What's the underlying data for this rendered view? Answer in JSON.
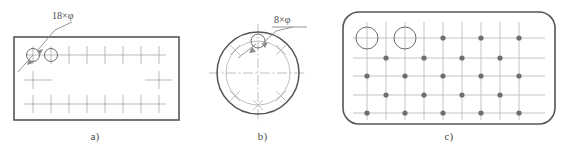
{
  "figure": {
    "background_color": "#ffffff",
    "line_color": "#6b6b6b",
    "outline_color": "#555555",
    "construction_color": "#b0b0b0",
    "dot_color": "#6e6e6e",
    "text_color": "#4a4a4a"
  },
  "panels": [
    {
      "id": "a",
      "caption": "a)",
      "shape": "rectangle",
      "annotation": {
        "label": "18×φ",
        "count": 18,
        "symbol": "φ",
        "leader": "arrow pointing to upper-left hole"
      },
      "outline": {
        "x": 14,
        "y": 37,
        "width": 165,
        "height": 83
      },
      "holes": [
        {
          "cx": 33,
          "cy": 55,
          "r": 6.5
        },
        {
          "cx": 51,
          "cy": 55,
          "r": 6.5
        }
      ],
      "grid": {
        "columns_x": [
          33,
          51,
          69,
          87,
          105,
          123,
          141,
          159
        ],
        "rows_y": [
          55,
          80,
          104
        ],
        "cross_size": 7,
        "row_line_spans": [
          {
            "y": 55,
            "x1": 27,
            "x2": 166
          },
          {
            "y": 80,
            "x1": 24,
            "x2": 52
          },
          {
            "y": 80,
            "x1": 145,
            "x2": 172
          },
          {
            "y": 104,
            "x1": 24,
            "x2": 166
          }
        ]
      }
    },
    {
      "id": "b",
      "caption": "b)",
      "shape": "circle",
      "annotation": {
        "label": "8×φ",
        "count": 8,
        "symbol": "φ",
        "leader": "arrow pointing to top hole"
      },
      "outer_circle": {
        "cx": 68,
        "cy": 73,
        "r": 41
      },
      "bolt_circle": {
        "cx": 68,
        "cy": 73,
        "r": 32
      },
      "hole": {
        "cx": 68,
        "cy": 41,
        "r": 7
      },
      "centerlines": {
        "horizontal": {
          "x1": 19,
          "x2": 117,
          "y": 73
        },
        "vertical": {
          "y1": 24,
          "y2": 122,
          "x": 68
        }
      },
      "tick_angles_deg": [
        45,
        90,
        135,
        225,
        270,
        315
      ]
    },
    {
      "id": "c",
      "caption": "c)",
      "shape": "rounded-rectangle",
      "outline": {
        "x": 8,
        "y": 12,
        "width": 212,
        "height": 112,
        "radius": 16
      },
      "holes": [
        {
          "cx": 32,
          "cy": 38,
          "r": 11
        },
        {
          "cx": 70,
          "cy": 38,
          "r": 11
        }
      ],
      "grid": {
        "columns_x": [
          32,
          51,
          70,
          89,
          108,
          127,
          146,
          165,
          184
        ],
        "rows_y": [
          38,
          58,
          76,
          95,
          113
        ],
        "line_margin": 10
      },
      "dots": {
        "radius": 2.6,
        "rows": [
          {
            "y": 38,
            "xs": [
              108,
              146,
              184
            ]
          },
          {
            "y": 58,
            "xs": [
              51,
              89,
              127,
              165
            ]
          },
          {
            "y": 76,
            "xs": [
              32,
              70,
              108,
              146,
              184
            ]
          },
          {
            "y": 95,
            "xs": [
              51,
              89,
              127,
              165
            ]
          },
          {
            "y": 113,
            "xs": [
              32,
              70,
              108,
              146,
              184
            ]
          }
        ]
      }
    }
  ]
}
